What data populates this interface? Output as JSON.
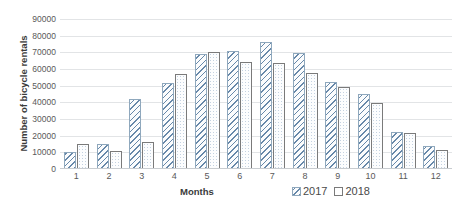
{
  "chart_data": {
    "type": "bar",
    "title": "",
    "xlabel": "Months",
    "ylabel": "Number of bicycle rentals",
    "categories": [
      "1",
      "2",
      "3",
      "4",
      "5",
      "6",
      "7",
      "8",
      "9",
      "10",
      "11",
      "12"
    ],
    "series": [
      {
        "name": "2017",
        "values": [
          10300,
          15100,
          42300,
          51400,
          69000,
          70700,
          76000,
          69500,
          52000,
          45000,
          22500,
          14000
        ]
      },
      {
        "name": "2018",
        "values": [
          14800,
          10900,
          16500,
          57200,
          70300,
          64500,
          63500,
          57500,
          49500,
          39500,
          21500,
          11500
        ]
      }
    ],
    "ylim": [
      0,
      90000
    ],
    "ytick_step": 10000,
    "yticks": [
      "0",
      "10000",
      "20000",
      "30000",
      "40000",
      "50000",
      "60000",
      "70000",
      "80000",
      "90000"
    ],
    "grid": true,
    "legend_position": "bottom-right",
    "colors": {
      "series_2017_outline": "#8fa8bd",
      "series_2017_hatch": "#5f82a5",
      "series_2018_outline": "#7a7a7a",
      "series_2018_fill": "#fcfdfe",
      "gridline": "#e2e4e6",
      "text": "#595959"
    }
  }
}
